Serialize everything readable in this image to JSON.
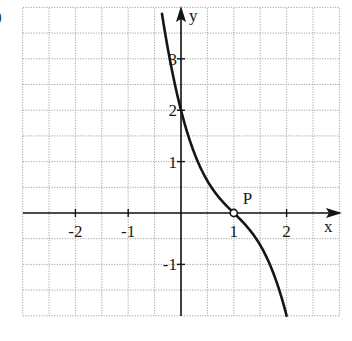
{
  "corner_label": ")",
  "chart_data": {
    "type": "line",
    "title": "",
    "xlabel": "x",
    "ylabel": "y",
    "xlim": [
      -3,
      3
    ],
    "ylim": [
      -2,
      4
    ],
    "grid": true,
    "grid_step": 0.5,
    "x_ticks": [
      -2,
      -1,
      1,
      2
    ],
    "x_tick_labels": [
      "-2",
      "-1",
      "1",
      "2"
    ],
    "y_ticks": [
      -1,
      1,
      2,
      3
    ],
    "y_tick_labels": [
      "-1",
      "1",
      "2",
      "3"
    ],
    "series": [
      {
        "name": "f(x) = -(x-1)^3 - (x-1)",
        "x": [
          -0.36,
          -0.25,
          0,
          0.25,
          0.5,
          0.75,
          1,
          1.25,
          1.5,
          1.75,
          2
        ],
        "y": [
          3.88,
          3.2,
          2.0,
          1.17,
          0.63,
          0.27,
          0.0,
          -0.27,
          -0.63,
          -1.17,
          -2.0
        ]
      }
    ],
    "annotations": [
      {
        "text": "P",
        "x": 1,
        "y": 0,
        "marker": "open-circle"
      }
    ],
    "colors": {
      "curve": "#151515",
      "axis": "#151515",
      "grid": "#9a9a9a"
    }
  }
}
